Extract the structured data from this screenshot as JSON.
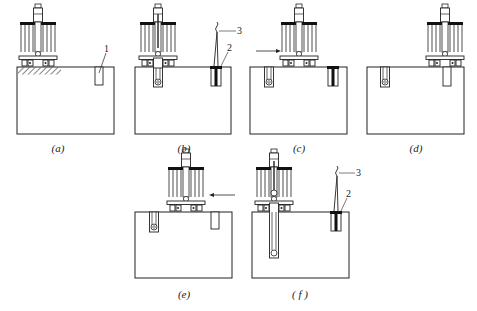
{
  "figure": {
    "panels": [
      {
        "id": "a",
        "caption": "(a)",
        "callouts": [
          {
            "number": "1",
            "target": "hole"
          }
        ]
      },
      {
        "id": "b",
        "caption": "(b)",
        "callouts": [
          {
            "number": "2",
            "target": "casing"
          },
          {
            "number": "3",
            "target": "hook"
          }
        ]
      },
      {
        "id": "c",
        "caption": "(c)",
        "arrow": "right"
      },
      {
        "id": "d",
        "caption": "(d)"
      },
      {
        "id": "e",
        "caption": "(e)",
        "arrow": "left"
      },
      {
        "id": "f",
        "caption": "( f )",
        "callouts": [
          {
            "number": "2",
            "target": "casing"
          },
          {
            "number": "3",
            "target": "hook"
          }
        ]
      }
    ]
  },
  "colors": {
    "stroke": "#222222",
    "background": "#ffffff",
    "fill_dark": "#111111"
  }
}
